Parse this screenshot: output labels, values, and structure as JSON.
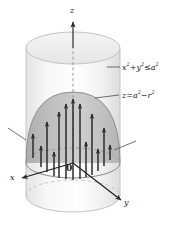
{
  "figure": {
    "axes": {
      "z_label": "z",
      "x_label": "x",
      "y_label": "y",
      "origin_label": "0"
    },
    "annotations": [
      {
        "name": "cylinder-equation",
        "text": "x² + y² ≤ a²",
        "parts": {
          "lhs_a": "x",
          "exp_a": "2",
          "plus": "+",
          "lhs_b": "y",
          "exp_b": "2",
          "rel": "≤",
          "rhs": "a",
          "exp_c": "2"
        }
      },
      {
        "name": "paraboloid-equation",
        "text": "z = a² − r²",
        "parts": {
          "lhs": "z",
          "eq": "=",
          "rhs_a": "a",
          "exp_a": "2",
          "minus": "−",
          "rhs_b": "r",
          "exp_b": "2"
        }
      }
    ],
    "colors": {
      "cylinder_fill": "#f2f2f2",
      "cylinder_stroke": "#c9c9c9",
      "paraboloid_fill": "#b9b9b9",
      "paraboloid_fill_light": "#cfcfcf",
      "paraboloid_stroke": "#8f8f8f",
      "arrow": "#2b2b2b",
      "axis": "#1a1a1a",
      "leader": "#4d4d4d",
      "dashed": "#9a9a9a",
      "text": "#1a1a1a"
    },
    "geometry": {
      "cylinder": {
        "cx": 73,
        "top_cy": 48,
        "bottom_cy": 196,
        "rx": 47,
        "ry": 16
      },
      "paraboloid": {
        "apex_y": 92,
        "base_cy": 163,
        "rx": 47,
        "ry": 15
      },
      "axis_z_top": 18,
      "axis_x_end": {
        "x": 18,
        "y": 176
      },
      "axis_y_end": {
        "x": 125,
        "y": 203
      }
    },
    "vector_field": {
      "name": "upward-arrows",
      "count": 13,
      "direction": "up",
      "arrows": [
        {
          "x": 33,
          "y_tail": 158,
          "y_head": 128
        },
        {
          "x": 41,
          "y_tail": 167,
          "y_head": 140
        },
        {
          "x": 47,
          "y_tail": 172,
          "y_head": 116
        },
        {
          "x": 54,
          "y_tail": 176,
          "y_head": 146
        },
        {
          "x": 59,
          "y_tail": 178,
          "y_head": 106
        },
        {
          "x": 66,
          "y_tail": 179,
          "y_head": 98
        },
        {
          "x": 73,
          "y_tail": 180,
          "y_head": 93
        },
        {
          "x": 80,
          "y_tail": 179,
          "y_head": 98
        },
        {
          "x": 86,
          "y_tail": 177,
          "y_head": 136
        },
        {
          "x": 92,
          "y_tail": 175,
          "y_head": 108
        },
        {
          "x": 98,
          "y_tail": 171,
          "y_head": 143
        },
        {
          "x": 104,
          "y_tail": 166,
          "y_head": 122
        },
        {
          "x": 110,
          "y_tail": 160,
          "y_head": 139
        }
      ]
    },
    "leader_lines": [
      {
        "name": "cylinder-leader",
        "x1": 120,
        "y1": 67,
        "x2": 107,
        "y2": 67
      },
      {
        "name": "paraboloid-leader",
        "x1": 119,
        "y1": 95,
        "x2": 95,
        "y2": 98
      },
      {
        "name": "left-tick-leader",
        "x1": 8,
        "y1": 128,
        "x2": 26,
        "y2": 140
      },
      {
        "name": "right-tick-leader",
        "x1": 136,
        "y1": 141,
        "x2": 114,
        "y2": 150
      }
    ]
  }
}
